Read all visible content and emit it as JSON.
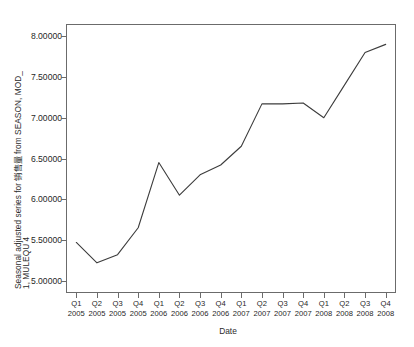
{
  "chart_data": {
    "type": "line",
    "title": "",
    "subtitle": "",
    "xlabel": "Date",
    "ylabel_line1": "Seasonal adjusted series for 销售量 from SEASON, MOD_",
    "ylabel_line2": "1, MULEQU 4",
    "categories": [
      "Q1 2005",
      "Q2 2005",
      "Q3 2005",
      "Q4 2005",
      "Q1 2006",
      "Q2 2006",
      "Q3 2006",
      "Q4 2006",
      "Q1 2007",
      "Q2 2007",
      "Q3 2007",
      "Q4 2007",
      "Q1 2008",
      "Q2 2008",
      "Q3 2008",
      "Q4 2008"
    ],
    "x_quarters": [
      "Q1",
      "Q2",
      "Q3",
      "Q4",
      "Q1",
      "Q2",
      "Q3",
      "Q4",
      "Q1",
      "Q2",
      "Q3",
      "Q4",
      "Q1",
      "Q2",
      "Q3",
      "Q4"
    ],
    "x_years": [
      "2005",
      "2005",
      "2005",
      "2005",
      "2006",
      "2006",
      "2006",
      "2006",
      "2007",
      "2007",
      "2007",
      "2007",
      "2008",
      "2008",
      "2008",
      "2008"
    ],
    "values": [
      5.47,
      5.22,
      5.32,
      5.65,
      6.45,
      6.05,
      6.3,
      6.42,
      6.65,
      7.17,
      7.17,
      7.18,
      7.0,
      7.4,
      7.8,
      7.9
    ],
    "ylim": [
      4.85,
      8.15
    ],
    "yticks": [
      5.0,
      5.5,
      6.0,
      6.5,
      7.0,
      7.5,
      8.0
    ],
    "ytick_labels": [
      "5.00000",
      "5.50000",
      "6.00000",
      "6.50000",
      "7.00000",
      "7.50000",
      "8.00000"
    ],
    "grid": false,
    "legend": "none",
    "series": [
      {
        "name": "Seasonal adjusted series",
        "color": "#3c3c3c",
        "values": [
          5.47,
          5.22,
          5.32,
          5.65,
          6.45,
          6.05,
          6.3,
          6.42,
          6.65,
          7.17,
          7.17,
          7.18,
          7.0,
          7.4,
          7.8,
          7.9
        ]
      }
    ]
  }
}
